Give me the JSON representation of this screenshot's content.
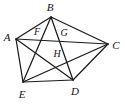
{
  "figure": {
    "type": "geometry-diagram",
    "stroke_color": "#1a1a1a",
    "background_color": "#ffffff",
    "label_color": "#111111",
    "viewbox": {
      "width": 125,
      "height": 105
    },
    "vertices": [
      {
        "id": "A",
        "label": "A",
        "x": 16,
        "y": 39,
        "label_x": 7,
        "label_y": 37,
        "kind": "outer"
      },
      {
        "id": "B",
        "label": "B",
        "x": 51,
        "y": 17,
        "label_x": 50,
        "label_y": 7,
        "kind": "outer"
      },
      {
        "id": "C",
        "label": "C",
        "x": 108,
        "y": 44,
        "label_x": 116,
        "label_y": 45,
        "kind": "outer"
      },
      {
        "id": "D",
        "label": "D",
        "x": 73,
        "y": 80,
        "label_x": 75,
        "label_y": 91,
        "kind": "outer"
      },
      {
        "id": "E",
        "label": "E",
        "x": 23,
        "y": 82,
        "label_x": 22,
        "label_y": 94,
        "kind": "outer"
      },
      {
        "id": "F",
        "label": "F",
        "x": 40,
        "y": 38,
        "label_x": 37,
        "label_y": 32,
        "kind": "intersection"
      },
      {
        "id": "G",
        "label": "G",
        "x": 62,
        "y": 40,
        "label_x": 64,
        "label_y": 33,
        "kind": "intersection"
      },
      {
        "id": "H",
        "label": "H",
        "x": 61,
        "y": 59,
        "label_x": 57,
        "label_y": 54,
        "kind": "intersection"
      }
    ],
    "segments": [
      {
        "id": "AB",
        "from": "A",
        "to": "B",
        "x1": 16,
        "y1": 39,
        "x2": 51,
        "y2": 17,
        "role": "side"
      },
      {
        "id": "BC",
        "from": "B",
        "to": "C",
        "x1": 51,
        "y1": 17,
        "x2": 108,
        "y2": 44,
        "role": "side"
      },
      {
        "id": "CD",
        "from": "C",
        "to": "D",
        "x1": 108,
        "y1": 44,
        "x2": 73,
        "y2": 80,
        "role": "side"
      },
      {
        "id": "DE",
        "from": "D",
        "to": "E",
        "x1": 73,
        "y1": 80,
        "x2": 23,
        "y2": 82,
        "role": "side"
      },
      {
        "id": "EA",
        "from": "E",
        "to": "A",
        "x1": 23,
        "y1": 82,
        "x2": 16,
        "y2": 39,
        "role": "side"
      },
      {
        "id": "AC",
        "from": "A",
        "to": "C",
        "x1": 16,
        "y1": 39,
        "x2": 108,
        "y2": 44,
        "role": "diagonal"
      },
      {
        "id": "AD",
        "from": "A",
        "to": "D",
        "x1": 16,
        "y1": 39,
        "x2": 73,
        "y2": 80,
        "role": "diagonal"
      },
      {
        "id": "BE",
        "from": "B",
        "to": "E",
        "x1": 51,
        "y1": 17,
        "x2": 23,
        "y2": 82,
        "role": "diagonal"
      },
      {
        "id": "BD",
        "from": "B",
        "to": "D",
        "x1": 51,
        "y1": 17,
        "x2": 73,
        "y2": 80,
        "role": "diagonal"
      },
      {
        "id": "EC",
        "from": "E",
        "to": "C",
        "x1": 23,
        "y1": 82,
        "x2": 108,
        "y2": 44,
        "role": "diagonal"
      }
    ]
  }
}
